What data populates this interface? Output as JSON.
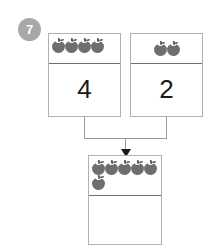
{
  "question": {
    "number": "7",
    "badge_color": "#a8a8a8"
  },
  "colors": {
    "counter": "#6e6e6e",
    "box_border": "#b0b0b0",
    "divider": "#6f6f6f",
    "connector": "#9a9a9a",
    "arrow": "#1a1a1a",
    "numeral": "#1a1a1a",
    "background": "#ffffff"
  },
  "icons": {
    "counter": "apple-icon",
    "arrow": "arrow-down-icon"
  },
  "addends": [
    {
      "name": "first-addend",
      "counter_count": 4,
      "counter_rows": [
        4
      ],
      "numeral": "4"
    },
    {
      "name": "second-addend",
      "counter_count": 2,
      "counter_rows": [
        2
      ],
      "numeral": "2"
    }
  ],
  "sum": {
    "name": "sum-total",
    "counter_count": 6,
    "counter_rows": [
      5,
      1
    ],
    "numeral": "",
    "numeral_placeholder": ""
  },
  "chart_data": {
    "type": "diagram",
    "title": "",
    "subtype": "part-part-whole addition bond",
    "operation": "addition",
    "parts": [
      4,
      2
    ],
    "whole_counters_shown": 6,
    "whole_numeral_shown": "",
    "counter_symbol": "apple",
    "expression": "4 + 2 = ?",
    "answer_blank": true
  }
}
